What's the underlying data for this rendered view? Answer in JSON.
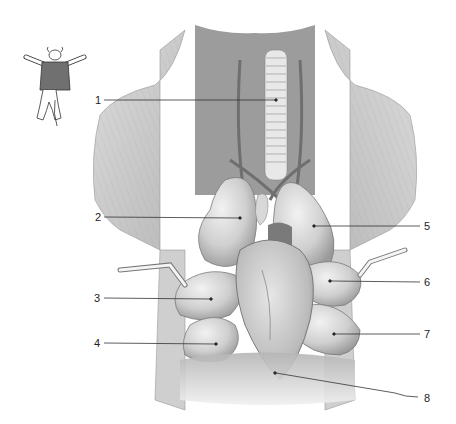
{
  "diagram": {
    "type": "anatomical-illustration",
    "style": "grayscale pencil illustration",
    "colors": {
      "background": "#ffffff",
      "tissue_light": "#e4e4e4",
      "tissue_mid": "#bdbdbd",
      "tissue_dark": "#8a8a8a",
      "leader_line": "#333333",
      "orientation_icon_fill": "#707070"
    }
  },
  "orientation_icon": {
    "description": "small animal figure lying on its back, torso shaded"
  },
  "labels": [
    {
      "number": "1",
      "side": "left",
      "y": 100,
      "target": "trachea"
    },
    {
      "number": "2",
      "side": "left",
      "y": 217,
      "target": "lung lobe (right cranial)"
    },
    {
      "number": "3",
      "side": "left",
      "y": 298,
      "target": "lung lobe (right middle)"
    },
    {
      "number": "4",
      "side": "left",
      "y": 343,
      "target": "lung lobe (right caudal)"
    },
    {
      "number": "5",
      "side": "right",
      "y": 226,
      "target": "lung lobe (left cranial)"
    },
    {
      "number": "6",
      "side": "right",
      "y": 281,
      "target": "lung lobe (left middle)"
    },
    {
      "number": "7",
      "side": "right",
      "y": 334,
      "target": "lung lobe (left caudal)"
    },
    {
      "number": "8",
      "side": "right",
      "y": 398,
      "target": "diaphragm"
    }
  ]
}
